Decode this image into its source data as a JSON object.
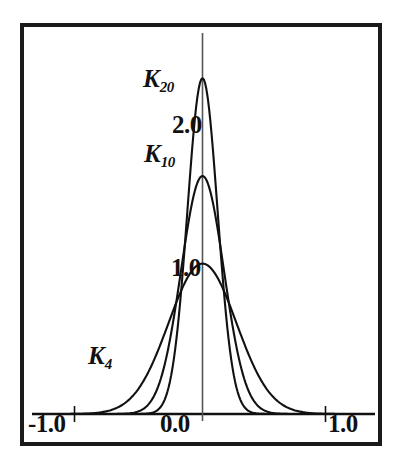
{
  "figure": {
    "background_color": "#ffffff",
    "line_color": "#111111",
    "frame_color": "#1a1a1a"
  },
  "axis": {
    "x_ticks": [
      {
        "label": "-1.0",
        "value": -1.0
      },
      {
        "label": "0.0",
        "value": 0.0
      },
      {
        "label": "1.0",
        "value": 1.0
      }
    ],
    "y_ticks": [
      {
        "label": "1.0",
        "value": 1.0
      },
      {
        "label": "2.0",
        "value": 2.0
      }
    ]
  },
  "curve_labels": {
    "k20_base": "K",
    "k20_sub": "20",
    "k10_base": "K",
    "k10_sub": "10",
    "k4_base": "K",
    "k4_sub": "4"
  },
  "chart_data": {
    "type": "line",
    "title": "",
    "subtitle": "",
    "xlabel": "",
    "ylabel": "",
    "xlim": [
      -1.35,
      1.35
    ],
    "ylim": [
      0.0,
      2.45
    ],
    "grid": false,
    "legend_position": "inline-annotations",
    "x_tick_labels": [
      "-1.0",
      "0.0",
      "1.0"
    ],
    "x_tick_values": [
      -1.0,
      0.0,
      1.0
    ],
    "y_tick_labels": [
      "1.0",
      "2.0"
    ],
    "y_tick_values": [
      1.0,
      2.0
    ],
    "annotations": [
      {
        "text": "K20",
        "x": -0.33,
        "y": 2.12
      },
      {
        "text": "2.0",
        "x": -0.16,
        "y": 1.75
      },
      {
        "text": "K10",
        "x": -0.32,
        "y": 1.54
      },
      {
        "text": "1.0",
        "x": -0.15,
        "y": 0.88
      },
      {
        "text": "K4",
        "x": -0.78,
        "y": 0.4
      }
    ],
    "series": [
      {
        "name": "K4",
        "peak_x": 0.0,
        "peak_y": 1.03,
        "half_width": 0.27,
        "support": [
          -0.96,
          0.82
        ],
        "x": [
          -1.0,
          -0.9,
          -0.8,
          -0.7,
          -0.6,
          -0.5,
          -0.4,
          -0.3,
          -0.2,
          -0.1,
          0.0,
          0.1,
          0.2,
          0.3,
          0.4,
          0.5,
          0.6,
          0.7,
          0.8,
          0.9,
          1.0
        ],
        "y": [
          0.01,
          0.02,
          0.04,
          0.08,
          0.15,
          0.26,
          0.42,
          0.62,
          0.82,
          0.97,
          1.03,
          0.97,
          0.82,
          0.62,
          0.42,
          0.26,
          0.15,
          0.08,
          0.04,
          0.02,
          0.01
        ]
      },
      {
        "name": "K10",
        "peak_x": 0.0,
        "peak_y": 1.63,
        "half_width": 0.17,
        "support": [
          -0.72,
          0.59
        ],
        "x": [
          -1.0,
          -0.9,
          -0.8,
          -0.7,
          -0.6,
          -0.5,
          -0.4,
          -0.3,
          -0.2,
          -0.1,
          0.0,
          0.1,
          0.2,
          0.3,
          0.4,
          0.5,
          0.6,
          0.7,
          0.8,
          0.9,
          1.0
        ],
        "y": [
          0.0,
          0.0,
          0.01,
          0.02,
          0.05,
          0.12,
          0.28,
          0.58,
          1.0,
          1.45,
          1.63,
          1.45,
          1.0,
          0.58,
          0.28,
          0.12,
          0.05,
          0.02,
          0.01,
          0.0,
          0.0
        ]
      },
      {
        "name": "K20",
        "peak_x": 0.0,
        "peak_y": 2.3,
        "half_width": 0.12,
        "support": [
          -0.54,
          0.48
        ],
        "x": [
          -1.0,
          -0.9,
          -0.8,
          -0.7,
          -0.6,
          -0.5,
          -0.4,
          -0.3,
          -0.2,
          -0.1,
          0.0,
          0.1,
          0.2,
          0.3,
          0.4,
          0.5,
          0.6,
          0.7,
          0.8,
          0.9,
          1.0
        ],
        "y": [
          0.0,
          0.0,
          0.0,
          0.0,
          0.01,
          0.03,
          0.11,
          0.36,
          0.93,
          1.82,
          2.3,
          1.82,
          0.93,
          0.36,
          0.11,
          0.03,
          0.01,
          0.0,
          0.0,
          0.0,
          0.0
        ]
      }
    ]
  }
}
